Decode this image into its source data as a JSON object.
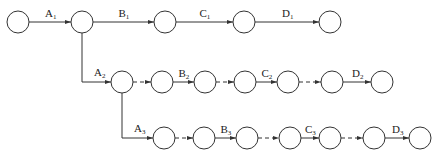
{
  "diagram": {
    "type": "network-diagram",
    "stroke_color": "#333333",
    "node_radius": 11,
    "nodes": [
      {
        "id": "r1n1",
        "x": 18,
        "y": 22
      },
      {
        "id": "r1n2",
        "x": 82,
        "y": 22
      },
      {
        "id": "r1n3",
        "x": 165,
        "y": 22
      },
      {
        "id": "r1n4",
        "x": 244,
        "y": 22
      },
      {
        "id": "r1n5",
        "x": 330,
        "y": 22
      },
      {
        "id": "r2n1",
        "x": 122,
        "y": 82
      },
      {
        "id": "r2n2",
        "x": 162,
        "y": 82
      },
      {
        "id": "r2n3",
        "x": 205,
        "y": 82
      },
      {
        "id": "r2n4",
        "x": 245,
        "y": 82
      },
      {
        "id": "r2n5",
        "x": 288,
        "y": 82
      },
      {
        "id": "r2n6",
        "x": 332,
        "y": 82
      },
      {
        "id": "r2n7",
        "x": 382,
        "y": 82
      },
      {
        "id": "r3n1",
        "x": 164,
        "y": 138
      },
      {
        "id": "r3n2",
        "x": 204,
        "y": 138
      },
      {
        "id": "r3n3",
        "x": 247,
        "y": 138
      },
      {
        "id": "r3n4",
        "x": 290,
        "y": 138
      },
      {
        "id": "r3n5",
        "x": 330,
        "y": 138
      },
      {
        "id": "r3n6",
        "x": 374,
        "y": 138
      },
      {
        "id": "r3n7",
        "x": 420,
        "y": 138
      }
    ],
    "activities": [
      {
        "from": "r1n1",
        "to": "r1n2",
        "label": "A",
        "sub": "1",
        "dashed": false
      },
      {
        "from": "r1n2",
        "to": "r1n3",
        "label": "B",
        "sub": "1",
        "dashed": false
      },
      {
        "from": "r1n3",
        "to": "r1n4",
        "label": "C",
        "sub": "1",
        "dashed": false
      },
      {
        "from": "r1n4",
        "to": "r1n5",
        "label": "D",
        "sub": "1",
        "dashed": false
      },
      {
        "from": "r1n2",
        "to": "r2n1",
        "label": "A",
        "sub": "2",
        "dashed": false,
        "elbow": true
      },
      {
        "from": "r2n1",
        "to": "r2n2",
        "label": "",
        "sub": "",
        "dashed": true
      },
      {
        "from": "r2n2",
        "to": "r2n3",
        "label": "B",
        "sub": "2",
        "dashed": false
      },
      {
        "from": "r2n3",
        "to": "r2n4",
        "label": "",
        "sub": "",
        "dashed": true
      },
      {
        "from": "r2n4",
        "to": "r2n5",
        "label": "C",
        "sub": "2",
        "dashed": false
      },
      {
        "from": "r2n5",
        "to": "r2n6",
        "label": "",
        "sub": "",
        "dashed": true
      },
      {
        "from": "r2n6",
        "to": "r2n7",
        "label": "D",
        "sub": "2",
        "dashed": false
      },
      {
        "from": "r2n1",
        "to": "r3n1",
        "label": "A",
        "sub": "3",
        "dashed": false,
        "elbow": true
      },
      {
        "from": "r3n1",
        "to": "r3n2",
        "label": "",
        "sub": "",
        "dashed": true
      },
      {
        "from": "r3n2",
        "to": "r3n3",
        "label": "B",
        "sub": "3",
        "dashed": false
      },
      {
        "from": "r3n3",
        "to": "r3n4",
        "label": "",
        "sub": "",
        "dashed": true
      },
      {
        "from": "r3n4",
        "to": "r3n5",
        "label": "C",
        "sub": "3",
        "dashed": false
      },
      {
        "from": "r3n5",
        "to": "r3n6",
        "label": "",
        "sub": "",
        "dashed": true
      },
      {
        "from": "r3n6",
        "to": "r3n7",
        "label": "D",
        "sub": "3",
        "dashed": false
      }
    ]
  }
}
